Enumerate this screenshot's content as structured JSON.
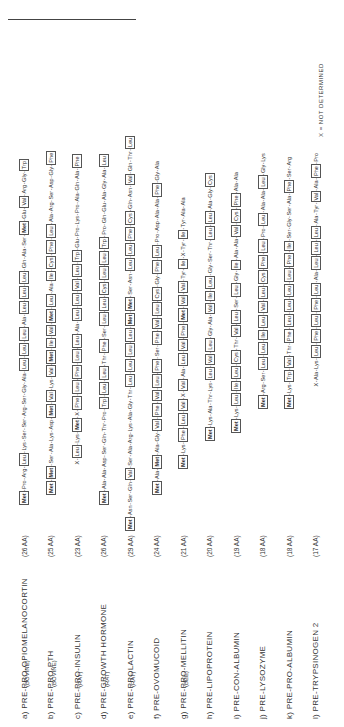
{
  "rows": [
    {
      "label": "a) PRE-PRO-OPIOMELANOCORTIN",
      "sub": "(BOVINE)",
      "aa": "(26 AA)",
      "seq": "Met-Pro-Arg-Leu-Lys-Ser-Ser-Arg-Ser-Gly-Ala-Leu-Leu-Leu-Ala-Leu-Leu-Leu-Gln-Ala-Ser-Met-Glu-Val-Arg-Gly-Trp",
      "start": 222
    },
    {
      "label": "b) PRE-PRO-PTH",
      "sub": "(BOVINE)",
      "aa": "(25 AA)",
      "seq": "Met-Met-Ser-Ala-Lys-Asp-Met-Val-Lys-Val-Met-Ile-Val-Met-Leu-Ala-Ile-Cys-Phe-Leu-Ala-Arg-Ser-Asp-Gly-Phe",
      "start": 232
    },
    {
      "label": "c) PRE-PRO-INSULIN",
      "sub": "(RAT)",
      "aa": "(23 AA)",
      "seq": "X-Leu-Lys-Met-X-Phe-Leu-Phe-Leu-Leu-Ala-Leu-Leu-Val-Leu-Trp-Glu-Pro-Lys-Pro-Ala-Gln-Ala-Phe",
      "start": 262
    },
    {
      "label": "d) PRE-GROWTH HORMONE",
      "sub": "(RAT)",
      "aa": "(26 AA)",
      "seq": "Met-Ala-Ala-Asp-Ser-Gln-Thr-Pro-Trp-Leu-Leu-Thr-Phe-Ser-Leu-Leu-Cys-Leu-Leu-Trp-Pro-Gln-Glu-Ala-Gly-Ala-Leu",
      "start": 222
    },
    {
      "label": "e) PRE-PROLACTIN",
      "sub": "(RAT)",
      "aa": "(29 AA)",
      "seq": "Met-Asn-Ser-Gln-Val-Ser-Ala-Arg-Lys-Ala-Gly-Thr-Leu-Leu-Leu-Leu-Met-Met-Ser-Asn-Leu-Leu-Phe-Cys-Gln-Asn-Val-Gln-Thr-Leu",
      "start": 196
    },
    {
      "label": "f) PRE-OVOMUCOID",
      "sub": "",
      "aa": "(24 AA)",
      "seq": "Met-Ala-Met-Ala-Gly-Val-Phe-Val-Leu-Phe-Ser-Phe-Val-Leu-Cys-Gly-Phe-Leu-Pro-Asp-Ala-Ala-Phe-Gly-Ala",
      "start": 232
    },
    {
      "label": "g) PRE-PRO-MELLITIN",
      "sub": "(BEE)",
      "aa": "(21 AA)",
      "seq": "Met-Lys-Phe-Leu-Val-X-Val-Ala-Leu-Val-Phe-Met-Val-Val-Tyr-Ile-X-Tyr-Ile-Tyr-Ala-Ala",
      "start": 258
    },
    {
      "label": "h) PRE-LIPOPROTEIN",
      "sub": "",
      "aa": "(20 AA)",
      "seq": "Met-Lys-Ala-Thr-Lys-Leu-Val-Leu-Gly-Ala-Val-Ile-Leu-Gly-Ser-Thr-Leu-Leu-Ala-Gly-Cys",
      "start": 286
    },
    {
      "label": "i) PRE-CON-ALBUMIN",
      "sub": "",
      "aa": "(19 AA)",
      "seq": "Met-Lys-Leu-Ile-Leu-Cys-Thr-Val-Leu-Ser-Leu-Gly-Ile-Ala-Ala-Val-Cys-Phe-Ala-Ala",
      "start": 294
    },
    {
      "label": "j) PRE-LYSOZYME",
      "sub": "",
      "aa": "(18 AA)",
      "seq": "Met-Arg-Ser-Leu-Leu-Ile-Leu-Val-Leu-Cys-Phe-Leu-Pro-Leu-Ala-Ala-Leu-Gly-Lys",
      "start": 318
    },
    {
      "label": "k) PRE-PRO-ALBUMIN",
      "sub": "",
      "aa": "(18 AA)",
      "seq": "Met-Lys-Trp-Val-Thr-Phe-Leu-Leu-Leu-Leu-Phe-Ile-Ser-Gly-Ser-Ala-Phe-Ser-Arg",
      "start": 318
    },
    {
      "label": "l) PRE-TRYPSINOGEN 2",
      "sub": "",
      "aa": "(17 AA)",
      "seq": "X-Ala-Lys-Leu-Phe-Leu-Phe-Leu-Ala-Leu-Leu-Leu-Ala-Tyr-Val-Ala-Phe-Pro",
      "start": 340
    }
  ],
  "footnote": "X = NOT DETERMINED"
}
